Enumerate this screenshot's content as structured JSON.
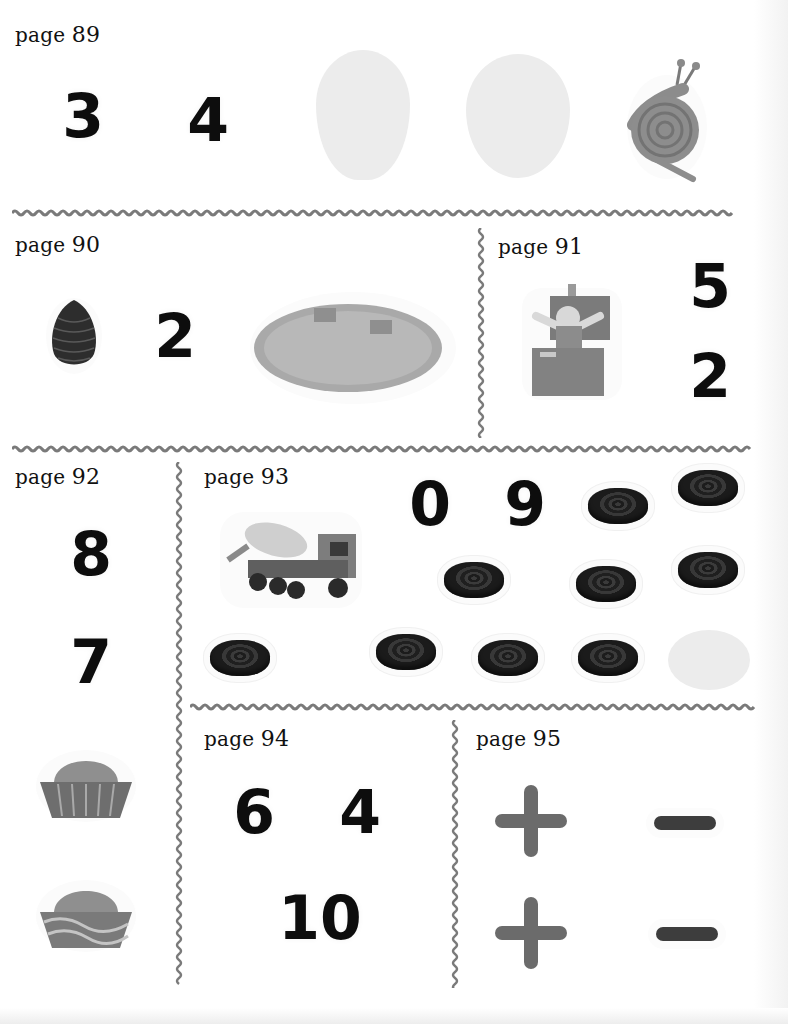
{
  "document": {
    "type": "sticker sheet",
    "sections": [
      {
        "id": "p89",
        "label_prefix": "page",
        "label_number": "89",
        "numerals": [
          "3",
          "4"
        ],
        "pictures": [
          "pale-petal",
          "pale-petal",
          "snail"
        ]
      },
      {
        "id": "p90",
        "label_prefix": "page",
        "label_number": "90",
        "numerals": [
          "2"
        ],
        "pictures": [
          "pine-cone",
          "wooden-cheese-board"
        ]
      },
      {
        "id": "p91",
        "label_prefix": "page",
        "label_number": "91",
        "numerals": [
          "5",
          "2"
        ],
        "pictures": [
          "jack-in-the-box"
        ]
      },
      {
        "id": "p92",
        "label_prefix": "page",
        "label_number": "92",
        "numerals": [
          "8",
          "7"
        ],
        "pictures": [
          "cupcake",
          "cupcake"
        ]
      },
      {
        "id": "p93",
        "label_prefix": "page",
        "label_number": "93",
        "numerals": [
          "0",
          "9"
        ],
        "pictures": [
          "cement-mixer-truck",
          "licorice-x9",
          "pale-circle"
        ]
      },
      {
        "id": "p94",
        "label_prefix": "page",
        "label_number": "94",
        "numerals": [
          "6",
          "4",
          "10"
        ],
        "pictures": []
      },
      {
        "id": "p95",
        "label_prefix": "page",
        "label_number": "95",
        "symbols": [
          "+",
          "−",
          "+",
          "−"
        ],
        "pictures": []
      }
    ]
  },
  "colors": {
    "divider": "#7a7a7a",
    "numeral": "#0d0d0d",
    "plus": "#6b6b6b",
    "minus": "#3d3d3d",
    "pale_shape": "#ececec"
  }
}
